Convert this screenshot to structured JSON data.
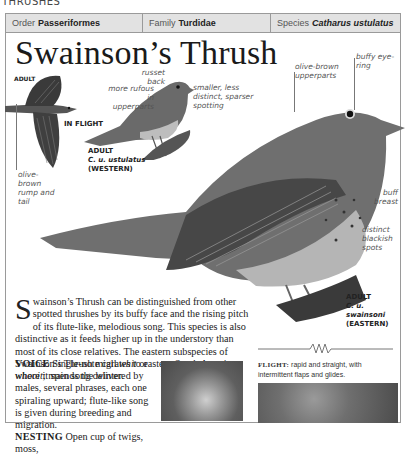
{
  "section_header": "THRUSHES",
  "taxonomy": {
    "order": {
      "label": "Order",
      "value": "Passeriformes"
    },
    "family": {
      "label": "Family",
      "value": "Turdidae"
    },
    "species": {
      "label": "Species",
      "value": "Catharus ustulatus"
    }
  },
  "title": "Swainson’s Thrush",
  "illustrations": {
    "flight_bird": {
      "tag_adult": "ADULT",
      "tag_flight": "IN FLIGHT",
      "label_rump": "olive-brown rump and tail"
    },
    "western_bird": {
      "tag_line1": "ADULT",
      "tag_line2": "C. u. ustulatus",
      "tag_line3": "(WESTERN)",
      "label_rufous": "more rufous in upperparts",
      "label_russet": "russet back",
      "label_spotting": "smaller, less distinct, sparser spotting"
    },
    "eastern_bird": {
      "tag_line1": "ADULT",
      "tag_line2": "C. u. swainsoni",
      "tag_line3": "(EASTERN)",
      "label_upperparts": "olive-brown upperparts",
      "label_eyering": "buffy eye-ring",
      "label_breast": "buff breast",
      "label_spots": "distinct blackish spots"
    }
  },
  "description": {
    "dropcap": "S",
    "text": "wainson’s Thrush can be distinguished from other spotted thrushes by its buffy face and the rising pitch of its flute-like, melodious song. This species is also distinctive as it feeds higher up in the understory than most of its close relatives. The eastern subspecies of Swainson’s Thrush migrates to eastern South America, where it spends the winter."
  },
  "voice": {
    "heading": "VOICE",
    "text_pre": "Single-note call ",
    "call1": "whit",
    "text_mid": " or ",
    "call2": "whooit",
    "text_post": "; main song delivered by males, several phrases, each one spiraling upward; flute-like song is given during breeding and migration."
  },
  "nesting": {
    "heading": "NESTING",
    "text": "Open cup of twigs, moss,"
  },
  "flight": {
    "heading": "FLIGHT:",
    "text": "rapid and straight, with intermittent flaps and glides."
  }
}
